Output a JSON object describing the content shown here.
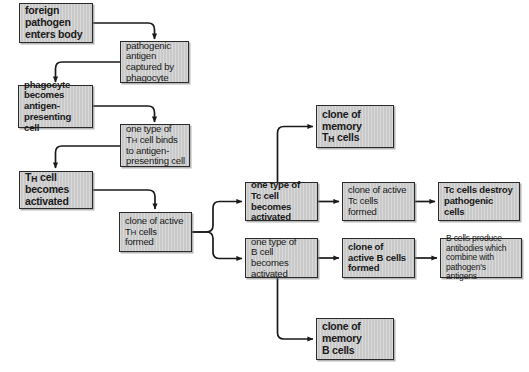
{
  "diagram": {
    "background_color": "#ffffff",
    "box_fill_color": "#c9c9c9",
    "box_border_color": "#2b2b2b",
    "connector_color": "#1a1a1a",
    "nodes": [
      {
        "id": "foreign-pathogen-enters-body",
        "label": "foreign pathogen enters body",
        "lines": [
          "foreign",
          "pathogen",
          "enters body"
        ],
        "bold": true,
        "x": 19,
        "y": 3,
        "w": 74,
        "h": 40
      },
      {
        "id": "pathogenic-antigen-captured",
        "label": "pathogenic antigen captured by phagocyte",
        "lines": [
          "pathogenic",
          "antigen",
          "captured by",
          "phagocyte"
        ],
        "bold": false,
        "x": 120,
        "y": 41,
        "w": 69,
        "h": 42
      },
      {
        "id": "phagocyte-becomes-apc",
        "label": "phagocyte becomes antigen-presenting cell",
        "lines": [
          "phagocyte",
          "becomes",
          "antigen-",
          "presenting cell"
        ],
        "bold": true,
        "x": 18,
        "y": 85,
        "w": 75,
        "h": 43
      },
      {
        "id": "th-cell-binds-to-apc",
        "label": "one type of TH cell binds to antigen-presenting cell",
        "lines": [
          "one type of",
          "T<sub>H</sub> cell binds",
          "to antigen-",
          "presenting cell"
        ],
        "bold": false,
        "x": 120,
        "y": 124,
        "w": 70,
        "h": 43
      },
      {
        "id": "th-cell-becomes-activated",
        "label": "TH cell becomes activated",
        "lines": [
          "T<sub>H</sub> cell",
          "becomes",
          "activated"
        ],
        "bold": true,
        "x": 19,
        "y": 171,
        "w": 74,
        "h": 38
      },
      {
        "id": "clone-of-active-th-cells",
        "label": "clone of active TH cells formed",
        "lines": [
          "clone of active",
          "T<sub>H</sub> cells",
          "formed"
        ],
        "bold": false,
        "x": 119,
        "y": 212,
        "w": 73,
        "h": 40
      },
      {
        "id": "clone-of-memory-th-cells",
        "label": "clone of memory TH cells",
        "lines": [
          "clone of",
          "memory",
          "T<sub>H</sub> cells"
        ],
        "bold": true,
        "x": 316,
        "y": 105,
        "w": 78,
        "h": 43
      },
      {
        "id": "tc-cell-becomes-activated",
        "label": "one type of Tc cell becomes activated",
        "lines": [
          "one type of",
          "Tc cell becomes",
          "activated"
        ],
        "bold": true,
        "x": 245,
        "y": 182,
        "w": 73,
        "h": 39
      },
      {
        "id": "clone-of-active-tc-cells",
        "label": "clone of active Tc cells formed",
        "lines": [
          "clone of active",
          "Tc cells",
          "formed"
        ],
        "bold": false,
        "x": 342,
        "y": 182,
        "w": 73,
        "h": 39
      },
      {
        "id": "tc-cells-destroy-pathogenic-cells",
        "label": "Tc cells destroy pathogenic cells",
        "lines": [
          "Tc cells destroy",
          "pathogenic",
          "cells"
        ],
        "bold": true,
        "x": 438,
        "y": 182,
        "w": 82,
        "h": 39
      },
      {
        "id": "b-cell-becomes-activated",
        "label": "one type of B cell becomes activated",
        "lines": [
          "one type of",
          "B cell becomes",
          "activated"
        ],
        "bold": false,
        "x": 245,
        "y": 238,
        "w": 73,
        "h": 40
      },
      {
        "id": "clone-of-active-b-cells",
        "label": "clone of active B cells formed",
        "lines": [
          "clone of",
          "active B cells",
          "formed"
        ],
        "bold": true,
        "x": 342,
        "y": 238,
        "w": 73,
        "h": 40
      },
      {
        "id": "b-cells-produce-antibodies",
        "label": "B cells produce antibodies which combine with pathogen's antigens",
        "lines": [
          "B cells produce",
          "antibodies which",
          "combine with",
          "pathogen's antigens"
        ],
        "bold": false,
        "x": 440,
        "y": 238,
        "w": 82,
        "h": 40
      },
      {
        "id": "clone-of-memory-b-cells",
        "label": "clone of memory B cells",
        "lines": [
          "clone of",
          "memory",
          "B cells"
        ],
        "bold": true,
        "x": 316,
        "y": 318,
        "w": 78,
        "h": 42
      }
    ],
    "connectors": [
      {
        "id": "pathogen-to-antigen",
        "from": "foreign-pathogen-enters-body",
        "to": "pathogenic-antigen-captured"
      },
      {
        "id": "antigen-to-phagocyte",
        "from": "pathogenic-antigen-captured",
        "to": "phagocyte-becomes-apc"
      },
      {
        "id": "phagocyte-to-thbinds",
        "from": "phagocyte-becomes-apc",
        "to": "th-cell-binds-to-apc"
      },
      {
        "id": "thbinds-to-thactivated",
        "from": "th-cell-binds-to-apc",
        "to": "th-cell-becomes-activated"
      },
      {
        "id": "thactivated-to-clonetha",
        "from": "th-cell-becomes-activated",
        "to": "clone-of-active-th-cells"
      },
      {
        "id": "clonetha-to-tc",
        "from": "clone-of-active-th-cells",
        "to": "tc-cell-becomes-activated"
      },
      {
        "id": "clonetha-to-b",
        "from": "clone-of-active-th-cells",
        "to": "b-cell-becomes-activated"
      },
      {
        "id": "tc-to-memoryth",
        "from": "tc-cell-becomes-activated",
        "to": "clone-of-memory-th-cells"
      },
      {
        "id": "tc-to-clonetc",
        "from": "tc-cell-becomes-activated",
        "to": "clone-of-active-tc-cells"
      },
      {
        "id": "clonetc-to-destroy",
        "from": "clone-of-active-tc-cells",
        "to": "tc-cells-destroy-pathogenic-cells"
      },
      {
        "id": "b-to-cloneb",
        "from": "b-cell-becomes-activated",
        "to": "clone-of-active-b-cells"
      },
      {
        "id": "cloneb-to-antibodies",
        "from": "clone-of-active-b-cells",
        "to": "b-cells-produce-antibodies"
      },
      {
        "id": "b-to-memoryb",
        "from": "b-cell-becomes-activated",
        "to": "clone-of-memory-b-cells"
      }
    ]
  }
}
